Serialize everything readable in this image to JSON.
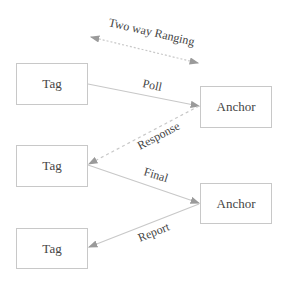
{
  "diagram": {
    "title": "Two way Ranging",
    "nodes": [
      {
        "id": "tag1",
        "label": "Tag"
      },
      {
        "id": "anchor1",
        "label": "Anchor"
      },
      {
        "id": "tag2",
        "label": "Tag"
      },
      {
        "id": "anchor2",
        "label": "Anchor"
      },
      {
        "id": "tag3",
        "label": "Tag"
      }
    ],
    "edges": [
      {
        "from": "tag1",
        "to": "anchor1",
        "label": "Poll",
        "style": "solid"
      },
      {
        "from": "anchor1",
        "to": "tag2",
        "label": "Response",
        "style": "dashed"
      },
      {
        "from": "tag2",
        "to": "anchor2",
        "label": "Final",
        "style": "solid"
      },
      {
        "from": "anchor2",
        "to": "tag3",
        "label": "Report",
        "style": "solid"
      }
    ],
    "colors": {
      "line": "#c8c8c8",
      "arrow": "#9a9a9a",
      "text": "#444444",
      "border": "#c8c8c8"
    }
  }
}
